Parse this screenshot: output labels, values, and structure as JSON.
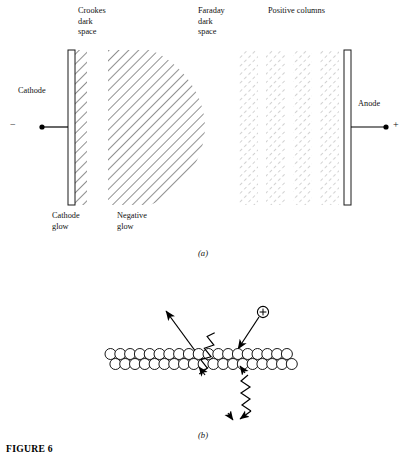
{
  "figure": {
    "caption": "FIGURE 6",
    "panel_a_letter": "(a)",
    "panel_b_letter": "(b)"
  },
  "panel_a": {
    "top_labels": [
      {
        "id": "crookes",
        "text": "Crookes\ndark\nspace",
        "x": 78,
        "y": 6
      },
      {
        "id": "faraday",
        "text": "Faraday\ndark\nspace",
        "x": 198,
        "y": 6
      },
      {
        "id": "positive_columns",
        "text": "Positive columns",
        "x": 268,
        "y": 6
      }
    ],
    "bottom_labels": [
      {
        "id": "cathode_glow",
        "text": "Cathode\nglow",
        "x": 52,
        "y": 211
      },
      {
        "id": "negative_glow",
        "text": "Negative\nglow",
        "x": 117,
        "y": 211
      }
    ],
    "cathode_label": "Cathode",
    "anode_label": "Anode",
    "minus_sign": "−",
    "plus_sign": "+",
    "cathode_electrode": {
      "x": 68,
      "y": 50,
      "w": 7,
      "h": 155
    },
    "anode_electrode": {
      "x": 344,
      "y": 50,
      "w": 7,
      "h": 155
    },
    "cathode_glow_band": {
      "x": 75,
      "y": 50,
      "w": 12,
      "h": 155
    },
    "negative_glow_shape": {
      "x": 108,
      "y": 50,
      "w": 97,
      "h": 155
    },
    "positive_columns": [
      {
        "x": 239,
        "y": 50,
        "w": 19,
        "h": 155
      },
      {
        "x": 266,
        "y": 50,
        "w": 19,
        "h": 155
      },
      {
        "x": 293,
        "y": 50,
        "w": 19,
        "h": 155
      },
      {
        "x": 320,
        "y": 50,
        "w": 19,
        "h": 155
      }
    ]
  },
  "panel_b": {
    "ion_symbol": "+",
    "surface": {
      "x": 105,
      "y": 348,
      "w": 190,
      "h": 22,
      "rows": 2,
      "circle_diameter": 11
    },
    "incoming_arrow": {
      "x1": 262,
      "y1": 312,
      "x2": 240,
      "y2": 348
    },
    "outgoing_arrow": {
      "x1": 196,
      "y1": 352,
      "x2": 165,
      "y2": 310
    },
    "zigzag_left": {
      "from_x": 205,
      "from_y": 372,
      "to_x": 232,
      "to_y": 412
    },
    "zigzag_right": {
      "from_x": 248,
      "from_y": 372,
      "to_x": 235,
      "to_y": 414
    }
  },
  "colors": {
    "ink": "#000000",
    "hatch_dark": "#2a2a2a",
    "hatch_light": "#9a9a9a",
    "text": "#111111"
  }
}
